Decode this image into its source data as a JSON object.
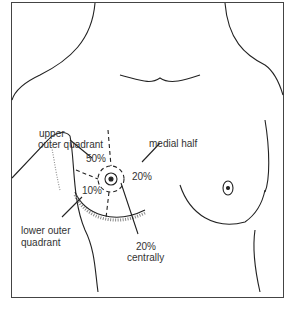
{
  "labels": {
    "upper_outer_1": "upper",
    "upper_outer_2": "outer quadrant",
    "pct_upper_outer": "50%",
    "medial_half": "medial half",
    "pct_medial": "20%",
    "pct_lower_outer": "10%",
    "lower_outer_1": "lower outer",
    "lower_outer_2": "quadrant",
    "pct_central": "20%",
    "central": "centrally"
  }
}
